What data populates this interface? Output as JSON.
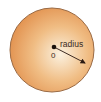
{
  "diagram": {
    "shape": "circle",
    "fill_color_center": "#fbf1df",
    "fill_color_edge": "#e49a55",
    "stroke_color": "#9a6a44",
    "center_label": "0",
    "radius_label": "radius",
    "arrow_color": "#2b1a12"
  }
}
